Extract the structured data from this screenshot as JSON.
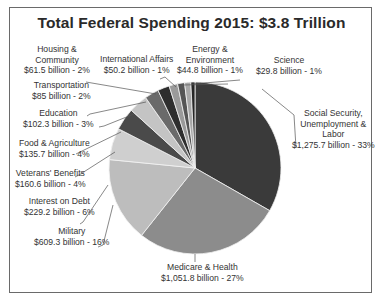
{
  "chart_data": {
    "type": "pie",
    "title": "Total Federal Spending 2015: $3.8 Trillion",
    "unit": "billion USD",
    "start_angle": "12 o'clock, clockwise",
    "slices": [
      {
        "label": "Social Security, Unemployment & Labor",
        "value": 1275.7,
        "percent": 33,
        "color": "#3a3a3a"
      },
      {
        "label": "Medicare & Health",
        "value": 1051.8,
        "percent": 27,
        "color": "#8c8c8c"
      },
      {
        "label": "Military",
        "value": 609.3,
        "percent": 16,
        "color": "#bdbdbd"
      },
      {
        "label": "Interest on Debt",
        "value": 229.2,
        "percent": 6,
        "color": "#cfcfcf"
      },
      {
        "label": "Veterans' Benefits",
        "value": 160.6,
        "percent": 4,
        "color": "#4a4a4a"
      },
      {
        "label": "Food & Agriculture",
        "value": 135.7,
        "percent": 4,
        "color": "#c4c4c4"
      },
      {
        "label": "Education",
        "value": 102.3,
        "percent": 3,
        "color": "#6a6a6a"
      },
      {
        "label": "Transportation",
        "value": 85,
        "percent": 2,
        "color": "#2e2e2e"
      },
      {
        "label": "Housing & Community",
        "value": 61.5,
        "percent": 2,
        "color": "#9a9a9a"
      },
      {
        "label": "International Affairs",
        "value": 50.2,
        "percent": 1,
        "color": "#555555"
      },
      {
        "label": "Energy & Environment",
        "value": 44.8,
        "percent": 1,
        "color": "#a8a8a8"
      },
      {
        "label": "Science",
        "value": 29.8,
        "percent": 1,
        "color": "#262626"
      }
    ]
  },
  "labels": {
    "social_security": {
      "l1": "Social Security,",
      "l2": "Unemployment &",
      "l3": "Labor",
      "l4": "$1,275.7 billion - 33%"
    },
    "medicare": {
      "l1": "Medicare & Health",
      "l2": "$1,051.8 billion - 27%"
    },
    "military": {
      "l1": "Military",
      "l2": "$609.3 billion - 16%"
    },
    "interest": {
      "l1": "Interest on Debt",
      "l2": "$229.2 billion - 6%"
    },
    "veterans": {
      "l1": "Veterans' Benefits",
      "l2": "$160.6 billion - 4%"
    },
    "food": {
      "l1": "Food & Agriculture",
      "l2": "$135.7 billion - 4%"
    },
    "education": {
      "l1": "Education",
      "l2": "$102.3 billion - 3%"
    },
    "transportation": {
      "l1": "Transportation",
      "l2": "$85 billion - 2%"
    },
    "housing": {
      "l1": "Housing &",
      "l2": "Community",
      "l3": "$61.5 billion - 2%"
    },
    "international": {
      "l1": "International Affairs",
      "l2": "$50.2 billion - 1%"
    },
    "energy": {
      "l1": "Energy &",
      "l2": "Environment",
      "l3": "$44.8 billion - 1%"
    },
    "science": {
      "l1": "Science",
      "l2": "$29.8 billion - 1%"
    }
  }
}
